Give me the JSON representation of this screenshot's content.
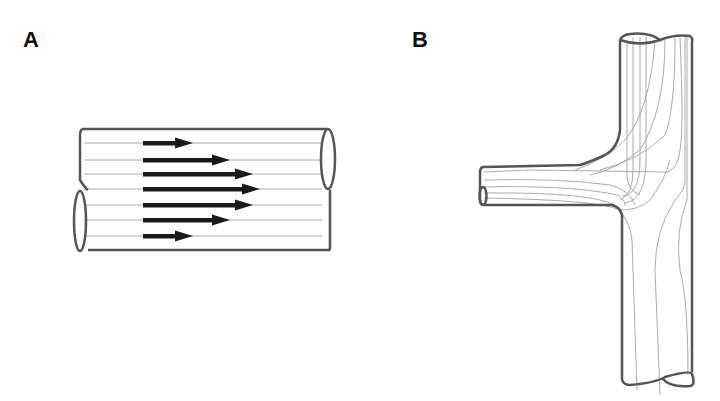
{
  "figure": {
    "panels": [
      {
        "label": "A",
        "description": "Laminar flow in a straight pipe with parabolic velocity profile",
        "streamline_count": 7,
        "velocity_arrows": {
          "count": 7,
          "relative_lengths": [
            0.38,
            0.67,
            0.85,
            0.9,
            0.85,
            0.67,
            0.38
          ]
        }
      },
      {
        "label": "B",
        "description": "Streamlines at a T-junction where a side branch joins a main vertical pipe"
      }
    ],
    "colors": {
      "outline": "#555555",
      "streamline": "#aaaaaa",
      "arrow": "#1a1a1a"
    }
  }
}
